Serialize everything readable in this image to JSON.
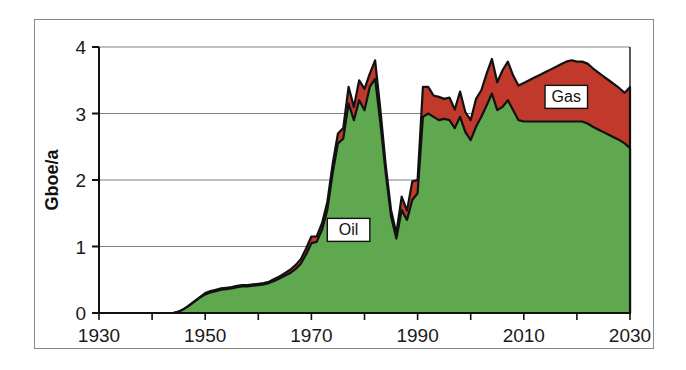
{
  "chart_data": {
    "type": "area",
    "stacked": true,
    "title": "",
    "subtitle": "",
    "xlabel": "",
    "ylabel": "Gboe/a",
    "xlim": [
      1930,
      2030
    ],
    "ylim": [
      0,
      4
    ],
    "x_ticks": [
      1930,
      1950,
      1970,
      1990,
      2010,
      2030
    ],
    "x_minor_tick_interval": 10,
    "y_ticks": [
      0,
      1,
      2,
      3,
      4
    ],
    "grid": "horizontal",
    "legend_position": "inline-annotations",
    "annotations": [
      {
        "text": "Oil",
        "x": 1977,
        "y": 1.25,
        "boxed": true
      },
      {
        "text": "Gas",
        "x": 2018,
        "y": 3.25,
        "boxed": true
      }
    ],
    "colors": {
      "oil": "#5FA850",
      "gas": "#C0392B",
      "outline": "#111111",
      "grid": "#808080",
      "axis": "#111111",
      "frame": "#8a8a8a",
      "background": "#ffffff"
    },
    "x": [
      1930,
      1931,
      1932,
      1933,
      1934,
      1935,
      1936,
      1937,
      1938,
      1939,
      1940,
      1941,
      1942,
      1943,
      1944,
      1945,
      1946,
      1947,
      1948,
      1949,
      1950,
      1951,
      1952,
      1953,
      1954,
      1955,
      1956,
      1957,
      1958,
      1959,
      1960,
      1961,
      1962,
      1963,
      1964,
      1965,
      1966,
      1967,
      1968,
      1969,
      1970,
      1971,
      1972,
      1973,
      1974,
      1975,
      1976,
      1977,
      1978,
      1979,
      1980,
      1981,
      1982,
      1983,
      1984,
      1985,
      1986,
      1987,
      1988,
      1989,
      1990,
      1991,
      1992,
      1993,
      1994,
      1995,
      1996,
      1997,
      1998,
      1999,
      2000,
      2001,
      2002,
      2003,
      2004,
      2005,
      2006,
      2007,
      2008,
      2009,
      2010,
      2011,
      2012,
      2013,
      2014,
      2015,
      2016,
      2017,
      2018,
      2019,
      2020,
      2021,
      2022,
      2023,
      2024,
      2025,
      2026,
      2027,
      2028,
      2029,
      2030
    ],
    "series": [
      {
        "name": "Oil",
        "color": "#5FA850",
        "values": [
          0.0,
          0.0,
          0.0,
          0.0,
          0.0,
          0.0,
          0.0,
          0.0,
          0.0,
          0.0,
          0.0,
          0.0,
          0.0,
          0.0,
          0.0,
          0.02,
          0.06,
          0.11,
          0.17,
          0.23,
          0.28,
          0.31,
          0.33,
          0.35,
          0.36,
          0.37,
          0.39,
          0.4,
          0.4,
          0.41,
          0.42,
          0.43,
          0.45,
          0.48,
          0.52,
          0.56,
          0.6,
          0.66,
          0.74,
          0.88,
          1.05,
          1.07,
          1.25,
          1.55,
          2.1,
          2.55,
          2.62,
          3.15,
          2.9,
          3.2,
          3.05,
          3.4,
          3.52,
          2.85,
          2.1,
          1.45,
          1.12,
          1.55,
          1.4,
          1.7,
          1.8,
          2.95,
          3.0,
          2.95,
          2.9,
          2.92,
          2.9,
          2.78,
          2.95,
          2.72,
          2.6,
          2.8,
          2.95,
          3.12,
          3.3,
          3.05,
          3.1,
          3.2,
          3.05,
          2.9,
          2.88,
          2.88,
          2.88,
          2.88,
          2.88,
          2.88,
          2.88,
          2.88,
          2.88,
          2.88,
          2.88,
          2.88,
          2.85,
          2.8,
          2.76,
          2.72,
          2.68,
          2.64,
          2.6,
          2.55,
          2.48
        ]
      },
      {
        "name": "Gas",
        "color": "#C0392B",
        "values": [
          0.0,
          0.0,
          0.0,
          0.0,
          0.0,
          0.0,
          0.0,
          0.0,
          0.0,
          0.0,
          0.0,
          0.0,
          0.0,
          0.0,
          0.0,
          0.0,
          0.0,
          0.01,
          0.01,
          0.01,
          0.02,
          0.02,
          0.02,
          0.02,
          0.02,
          0.02,
          0.02,
          0.02,
          0.02,
          0.02,
          0.02,
          0.02,
          0.02,
          0.03,
          0.03,
          0.04,
          0.05,
          0.06,
          0.07,
          0.09,
          0.1,
          0.08,
          0.1,
          0.12,
          0.14,
          0.15,
          0.16,
          0.25,
          0.2,
          0.3,
          0.32,
          0.2,
          0.28,
          0.2,
          0.12,
          0.1,
          0.08,
          0.2,
          0.14,
          0.28,
          0.2,
          0.45,
          0.4,
          0.32,
          0.35,
          0.3,
          0.34,
          0.28,
          0.38,
          0.3,
          0.3,
          0.42,
          0.4,
          0.48,
          0.52,
          0.42,
          0.55,
          0.58,
          0.52,
          0.52,
          0.58,
          0.62,
          0.66,
          0.7,
          0.74,
          0.78,
          0.82,
          0.86,
          0.9,
          0.92,
          0.9,
          0.9,
          0.9,
          0.88,
          0.86,
          0.84,
          0.82,
          0.8,
          0.78,
          0.76,
          0.92
        ]
      }
    ]
  },
  "axes": {
    "y_title": "Gboe/a",
    "y_tick_labels": [
      "0",
      "1",
      "2",
      "3",
      "4"
    ],
    "x_tick_labels": [
      "1930",
      "1950",
      "1970",
      "1990",
      "2010",
      "2030"
    ]
  },
  "labels": {
    "oil": "Oil",
    "gas": "Gas"
  }
}
